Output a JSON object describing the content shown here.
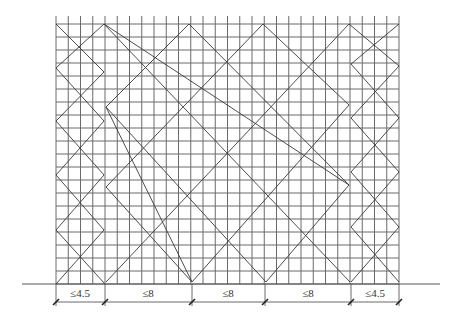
{
  "figure": {
    "canvas": {
      "width": 454,
      "height": 326
    },
    "colors": {
      "grid": "#6a6a6a",
      "brace": "#3a3a3a",
      "ground": "#555555",
      "dimension": "#444444",
      "text": "#333333"
    }
  },
  "grid": {
    "left": 56,
    "right": 399,
    "top": 24,
    "bottom": 284,
    "post_top": 16,
    "bays": 28,
    "rows": 20
  },
  "ground": {
    "x1": 22,
    "x2": 440,
    "y": 284
  },
  "braces": {
    "left_panel": [
      [
        [
          56,
          24
        ],
        [
          104,
          72
        ],
        [
          56,
          121
        ],
        [
          104,
          175
        ],
        [
          56,
          230
        ],
        [
          105,
          284
        ]
      ],
      [
        [
          104,
          24
        ],
        [
          56,
          68
        ],
        [
          104,
          121
        ],
        [
          56,
          175
        ],
        [
          104,
          230
        ],
        [
          56,
          284
        ]
      ]
    ],
    "center_panel": [
      [
        [
          104,
          24
        ],
        [
          349,
          185
        ]
      ],
      [
        [
          104,
          24
        ],
        [
          106,
          24
        ]
      ],
      [
        [
          189,
          24
        ],
        [
          106,
          107
        ],
        [
          192,
          282
        ]
      ],
      [
        [
          189,
          24
        ],
        [
          349,
          185
        ]
      ],
      [
        [
          106,
          107
        ],
        [
          266,
          282
        ]
      ],
      [
        [
          106,
          187
        ],
        [
          192,
          282
        ]
      ],
      [
        [
          106,
          187
        ],
        [
          263,
          24
        ]
      ],
      [
        [
          263,
          24
        ],
        [
          349,
          105
        ]
      ],
      [
        [
          104,
          24
        ],
        [
          350,
          282
        ]
      ],
      [
        [
          106,
          282
        ],
        [
          349,
          24
        ]
      ],
      [
        [
          192,
          282
        ],
        [
          349,
          105
        ]
      ],
      [
        [
          266,
          282
        ],
        [
          349,
          185
        ]
      ],
      [
        [
          106,
          107
        ],
        [
          106,
          187
        ]
      ]
    ],
    "right_panel": [
      [
        [
          349,
          24
        ],
        [
          399,
          66
        ],
        [
          351,
          118
        ],
        [
          399,
          172
        ],
        [
          351,
          227
        ],
        [
          399,
          282
        ]
      ],
      [
        [
          399,
          24
        ],
        [
          351,
          64
        ],
        [
          399,
          118
        ],
        [
          351,
          172
        ],
        [
          399,
          227
        ],
        [
          351,
          282
        ]
      ]
    ]
  },
  "dimensions": {
    "y": 302,
    "ticks_x": [
      56,
      105,
      192,
      265,
      351,
      399
    ],
    "labels": [
      {
        "text": "≤4.5",
        "x": 80
      },
      {
        "text": "≤8",
        "x": 148
      },
      {
        "text": "≤8",
        "x": 228
      },
      {
        "text": "≤8",
        "x": 308
      },
      {
        "text": "≤4.5",
        "x": 375
      }
    ]
  }
}
